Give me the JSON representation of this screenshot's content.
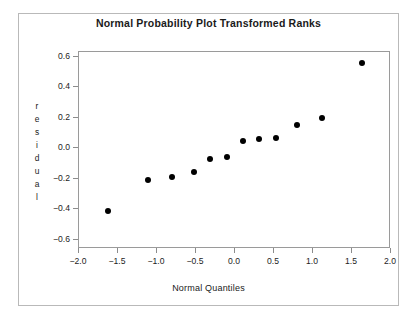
{
  "chart_data": {
    "type": "scatter",
    "title": "Normal Probability Plot Transformed Ranks",
    "xlabel": "Normal Quantiles",
    "ylabel": "residual",
    "ylabel_letters": [
      "r",
      "e",
      "s",
      "i",
      "d",
      "u",
      "a",
      "l"
    ],
    "xlim": [
      -2.0,
      2.0
    ],
    "ylim": [
      -0.66,
      0.63
    ],
    "xticks": [
      -2.0,
      -1.5,
      -1.0,
      -0.5,
      0.0,
      0.5,
      1.0,
      1.5,
      2.0
    ],
    "xtick_labels": [
      "-2.0",
      "-1.5",
      "-1.0",
      "-0.5",
      "0.0",
      "0.5",
      "1.0",
      "1.5",
      "2.0"
    ],
    "yticks": [
      0.6,
      0.4,
      0.2,
      0.0,
      -0.2,
      -0.4,
      -0.6
    ],
    "ytick_labels": [
      "0.6",
      "0.4",
      "0.2",
      "0.0",
      "-0.2",
      "-0.4",
      "-0.6"
    ],
    "grid": false,
    "legend": null,
    "marker": "filled-circle",
    "marker_color": "#000000",
    "x": [
      -1.63,
      -1.12,
      -0.81,
      -0.53,
      -0.32,
      -0.1,
      0.1,
      0.31,
      0.53,
      0.79,
      1.11,
      1.63
    ],
    "y": [
      -0.41,
      -0.21,
      -0.19,
      -0.155,
      -0.07,
      -0.055,
      0.05,
      0.06,
      0.065,
      0.155,
      0.2,
      0.56
    ],
    "points": [
      {
        "x": -1.63,
        "y": -0.41
      },
      {
        "x": -1.12,
        "y": -0.21
      },
      {
        "x": -0.81,
        "y": -0.19
      },
      {
        "x": -0.53,
        "y": -0.155
      },
      {
        "x": -0.32,
        "y": -0.07
      },
      {
        "x": -0.1,
        "y": -0.055
      },
      {
        "x": 0.1,
        "y": 0.05
      },
      {
        "x": 0.31,
        "y": 0.06
      },
      {
        "x": 0.53,
        "y": 0.065
      },
      {
        "x": 0.79,
        "y": 0.155
      },
      {
        "x": 1.11,
        "y": 0.2
      },
      {
        "x": 1.63,
        "y": 0.56
      }
    ],
    "n_points": 12
  },
  "colors": {
    "background": "#ffffff",
    "marker": "#000000",
    "panel_border": "#9a9a9a",
    "outer_border": "#b9b9b9",
    "text": "#1a1a1a"
  }
}
